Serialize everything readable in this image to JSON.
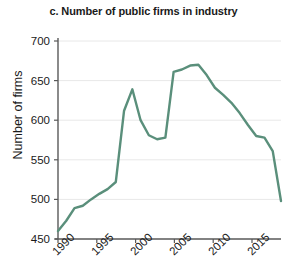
{
  "chart_data": {
    "type": "line",
    "title": "c. Number of public firms in industry",
    "xlabel": "",
    "ylabel": "Number of firms",
    "xlim": [
      1990,
      2017
    ],
    "ylim": [
      450,
      700
    ],
    "xticks": [
      1990,
      1995,
      2000,
      2005,
      2010,
      2015
    ],
    "yticks": [
      450,
      500,
      550,
      600,
      650,
      700
    ],
    "grid": true,
    "legend": "none",
    "line_color": "#5a8f7b",
    "series": [
      {
        "name": "Number of public firms",
        "x": [
          1990,
          1991,
          1992,
          1993,
          1994,
          1995,
          1996,
          1997,
          1998,
          1999,
          2000,
          2001,
          2002,
          2003,
          2004,
          2005,
          2006,
          2007,
          2008,
          2009,
          2010,
          2011,
          2012,
          2013,
          2014,
          2015,
          2016,
          2017
        ],
        "values": [
          460,
          473,
          489,
          492,
          500,
          507,
          513,
          522,
          612,
          639,
          600,
          581,
          576,
          578,
          661,
          664,
          669,
          670,
          657,
          641,
          632,
          622,
          609,
          594,
          580,
          578,
          561,
          498
        ]
      }
    ]
  },
  "axis": {
    "ytick_labels": [
      "700",
      "650",
      "600",
      "550",
      "500",
      "450"
    ],
    "xtick_labels": [
      "1990",
      "1995",
      "2000",
      "2005",
      "2010",
      "2015"
    ]
  }
}
